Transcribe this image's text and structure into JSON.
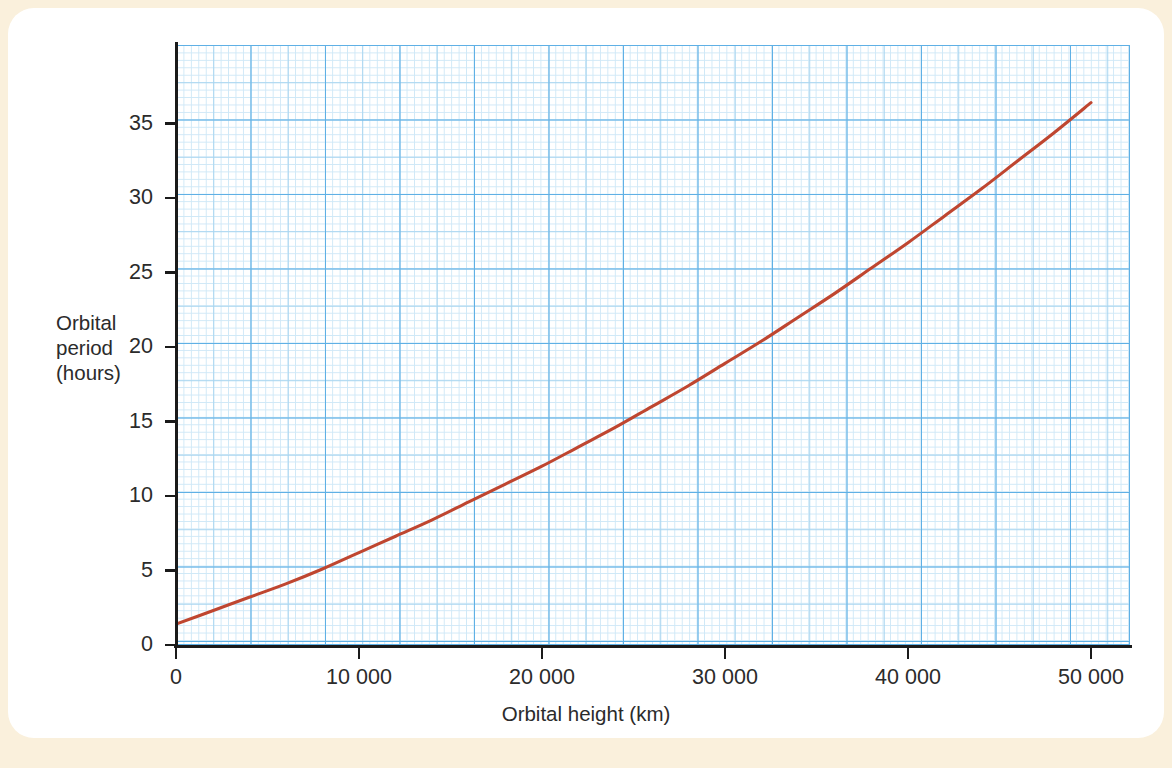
{
  "figure": {
    "background_color": "#faf0dc",
    "card_color": "#ffffff",
    "curve_color": "#bf4630",
    "grid_major_color": "#5fb0e5",
    "grid_minor_color": "#a8d5f0",
    "grid_fine_color": "#cfe8f7",
    "axis_color": "#1a1a1a"
  },
  "axis_titles": {
    "y_line1": "Orbital",
    "y_line2": "period",
    "y_line3": "(hours)",
    "x": "Orbital height (km)"
  },
  "y_ticks": [
    {
      "label": "0",
      "value": 0
    },
    {
      "label": "5",
      "value": 5
    },
    {
      "label": "10",
      "value": 10
    },
    {
      "label": "15",
      "value": 15
    },
    {
      "label": "20",
      "value": 20
    },
    {
      "label": "25",
      "value": 25
    },
    {
      "label": "30",
      "value": 30
    },
    {
      "label": "35",
      "value": 35
    }
  ],
  "x_ticks": [
    {
      "label": "0",
      "value": 0
    },
    {
      "label": "10 000",
      "value": 10000
    },
    {
      "label": "20 000",
      "value": 20000
    },
    {
      "label": "30 000",
      "value": 30000
    },
    {
      "label": "40 000",
      "value": 40000
    },
    {
      "label": "50 000",
      "value": 50000
    }
  ],
  "chart_data": {
    "type": "line",
    "title": "",
    "xlabel": "Orbital height (km)",
    "ylabel": "Orbital period (hours)",
    "xlim": [
      0,
      52000
    ],
    "ylim": [
      0,
      40
    ],
    "grid": true,
    "legend": "none",
    "series": [
      {
        "name": "Orbital period vs orbital height",
        "color": "#bf4630",
        "x": [
          0,
          2000,
          4000,
          6000,
          8000,
          10000,
          12000,
          14000,
          16000,
          18000,
          20000,
          22000,
          24000,
          26000,
          28000,
          30000,
          32000,
          34000,
          36000,
          38000,
          40000,
          42000,
          44000,
          46000,
          48000,
          50000
        ],
        "y": [
          1.4,
          2.3,
          3.2,
          4.1,
          5.1,
          6.2,
          7.3,
          8.4,
          9.6,
          10.8,
          12.0,
          13.3,
          14.6,
          16.0,
          17.4,
          18.9,
          20.4,
          22.0,
          23.6,
          25.3,
          27.0,
          28.8,
          30.6,
          32.5,
          34.4,
          36.4
        ]
      }
    ],
    "annotations": []
  }
}
